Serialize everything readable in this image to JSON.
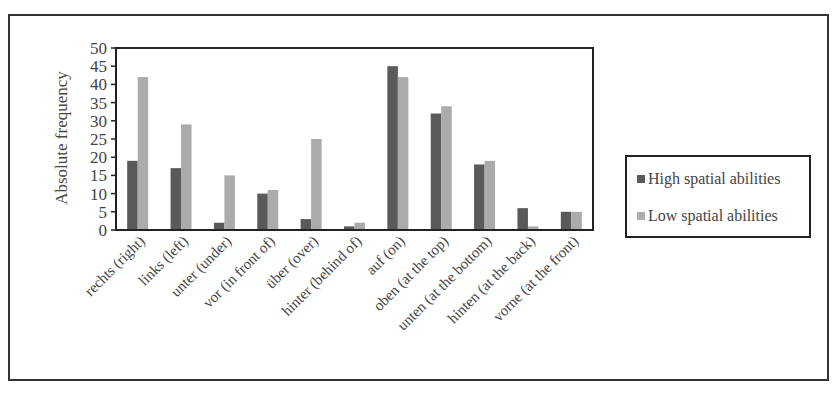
{
  "chart_data": {
    "type": "bar",
    "title": "",
    "xlabel": "",
    "ylabel": "Absolute frequency",
    "ylim": [
      0,
      50
    ],
    "yticks": [
      0,
      5,
      10,
      15,
      20,
      25,
      30,
      35,
      40,
      45,
      50
    ],
    "grid": false,
    "legend_position": "right",
    "categories": [
      "rechts (right)",
      "links (left)",
      "unter (under)",
      "vor (in front of)",
      "über (over)",
      "hinter (behind of)",
      "auf (on)",
      "oben (at the top)",
      "unten (at the bottom)",
      "hinten (at the back)",
      "vorne (at the front)"
    ],
    "series": [
      {
        "name": "High spatial abilities",
        "color": "#5a5a5a",
        "values": [
          19,
          17,
          2,
          10,
          3,
          1,
          45,
          32,
          18,
          6,
          5
        ]
      },
      {
        "name": "Low spatial abilities",
        "color": "#ababab",
        "values": [
          42,
          29,
          15,
          11,
          25,
          2,
          42,
          34,
          19,
          1,
          5
        ]
      }
    ]
  },
  "legend": {
    "items": [
      {
        "label": "High spatial abilities",
        "color": "#5a5a5a"
      },
      {
        "label": "Low spatial abilities",
        "color": "#ababab"
      }
    ]
  }
}
